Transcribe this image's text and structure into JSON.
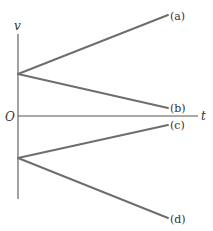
{
  "diagram": {
    "type": "velocity-time graph",
    "axes": {
      "y_label": "v",
      "x_label": "t",
      "origin_label": "O"
    },
    "lines": [
      {
        "label": "(a)",
        "start": "positive v-intercept",
        "slope": "positive"
      },
      {
        "label": "(b)",
        "start": "positive v-intercept",
        "slope": "negative, ends above t-axis"
      },
      {
        "label": "(c)",
        "start": "negative v-intercept",
        "slope": "positive, ends below t-axis"
      },
      {
        "label": "(d)",
        "start": "negative v-intercept",
        "slope": "negative"
      }
    ],
    "colors": {
      "axis": "#555555",
      "line": "#6e6e6e",
      "text": "#333333"
    }
  }
}
